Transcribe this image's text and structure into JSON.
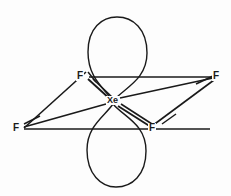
{
  "diagram": {
    "center_atom": {
      "label": "Xe",
      "x": 113,
      "y": 101
    },
    "ligands": [
      {
        "name": "fluorine-top-left",
        "label": "F",
        "x": 80,
        "y": 77
      },
      {
        "name": "fluorine-top-right",
        "label": "F",
        "x": 216,
        "y": 77
      },
      {
        "name": "fluorine-bottom-left",
        "label": "F",
        "x": 17,
        "y": 129
      },
      {
        "name": "fluorine-bottom-right",
        "label": "F",
        "x": 153,
        "y": 129
      }
    ],
    "lone_pairs": [
      {
        "name": "lone-pair-top",
        "orientation": "up"
      },
      {
        "name": "lone-pair-bottom",
        "orientation": "down"
      }
    ],
    "colors": {
      "stroke": "#1a1a1a",
      "background": "#fdfdfd"
    }
  }
}
